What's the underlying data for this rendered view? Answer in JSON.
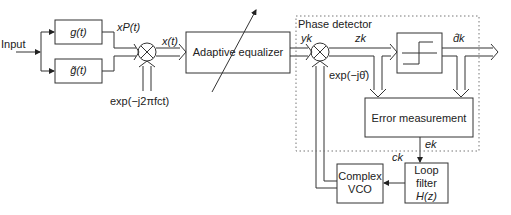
{
  "diagram": {
    "input_label": "Input",
    "blocks": {
      "g": "g(t)",
      "g_tilde": "g̃(t)",
      "adaptive_equalizer": "Adaptive equalizer",
      "error_measurement": "Error measurement",
      "complex_vco_line1": "Complex",
      "complex_vco_line2": "VCO",
      "loop_filter_line1": "Loop",
      "loop_filter_line2": "filter",
      "loop_filter_line3": "H(z)"
    },
    "group_label": "Phase detector",
    "signals": {
      "xp": "xP(t)",
      "x": "x(t)",
      "carrier": "exp(−j2πfct)",
      "yk": "yk",
      "zk": "zk",
      "theta": "exp(−jθ̂)",
      "dk": "d̂k",
      "ek": "ek",
      "ck": "ck"
    },
    "colors": {
      "line": "#333333",
      "dotted": "#777777"
    }
  }
}
